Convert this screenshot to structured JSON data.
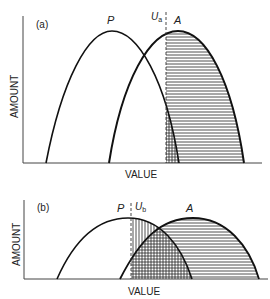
{
  "panels": [
    {
      "id": "a",
      "panel_label": "(a)",
      "y_axis_label": "AMOUNT",
      "x_axis_label": "VALUE",
      "curve_p_label": "P",
      "curve_a_label": "A",
      "threshold_label": "U",
      "threshold_sub": "a"
    },
    {
      "id": "b",
      "panel_label": "(b)",
      "y_axis_label": "AMOUNT",
      "x_axis_label": "VALUE",
      "curve_p_label": "P",
      "curve_a_label": "A",
      "threshold_label": "U",
      "threshold_sub": "b"
    }
  ],
  "colors": {
    "ink": "#111111",
    "axis": "#333333",
    "background": "#ffffff"
  }
}
